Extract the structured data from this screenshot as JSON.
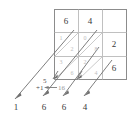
{
  "figure": {
    "type": "lattice-multiplication-diagram",
    "colors": {
      "grid_stroke": "#8c8c8c",
      "inner_stroke": "#c9c9c9",
      "diagonal_stroke": "#b5b5b5",
      "arrow_stroke": "#6f6f6f",
      "digit_color": "#3a3a3a",
      "faint_digit_color": "#bdbdbd",
      "background": "#ffffff"
    },
    "top_factors": [
      {
        "label": "6",
        "column": 0
      },
      {
        "label": "4",
        "column": 1
      },
      {
        "label": "",
        "column": 2
      }
    ],
    "right_factors": [
      {
        "label": "2",
        "row": 1
      },
      {
        "label": "6",
        "row": 2
      }
    ],
    "lattice_cells": [
      {
        "row": 1,
        "col": 0,
        "upper": "1",
        "lower": "2"
      },
      {
        "row": 1,
        "col": 1,
        "upper": "0",
        "lower": "8"
      },
      {
        "row": 2,
        "col": 0,
        "upper": "3",
        "lower": "6"
      },
      {
        "row": 2,
        "col": 1,
        "upper": "2",
        "lower": "4"
      }
    ],
    "carry_note": {
      "sum_label": "5",
      "carry_label": "+1",
      "arrow_glyph": "←",
      "source_label": "16"
    },
    "result_digits": [
      {
        "label": "1"
      },
      {
        "label": "6"
      },
      {
        "label": "6"
      },
      {
        "label": "4"
      }
    ]
  }
}
